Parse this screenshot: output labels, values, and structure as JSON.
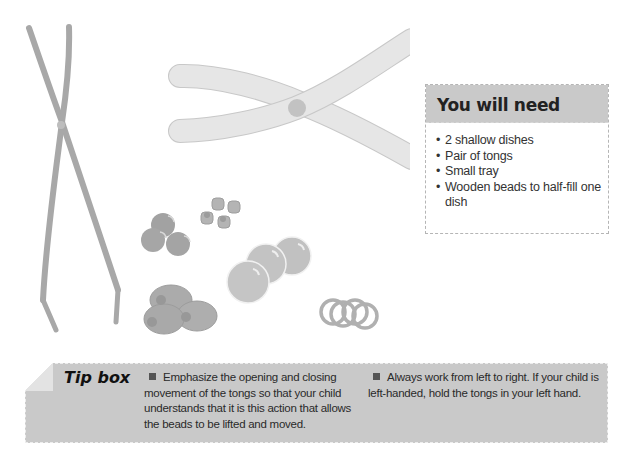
{
  "you_will_need": {
    "title": "You will need",
    "items": [
      "2 shallow dishes",
      "Pair of tongs",
      "Small tray",
      "Wooden beads to half-fill one dish"
    ]
  },
  "tip_box": {
    "label": "Tip box",
    "tips": [
      "Emphasize the opening and closing movement of the tongs so that your child understands that it is this action that allows the beads to be lifted and moved.",
      "Always work from left to right. If your child is left-handed, hold the tongs in your left hand."
    ]
  },
  "illustrations": {
    "items": [
      "tongs-closed-icon",
      "tongs-open-icon",
      "bead-cluster-icon",
      "cylinder-beads-icon",
      "large-beads-icon",
      "oval-beads-icon",
      "ring-beads-icon"
    ]
  },
  "colors": {
    "header_gray": "#c9c9c9",
    "tip_gray": "#c9c9c9",
    "illus_gray": "#a9a9a9",
    "illus_light": "#e6e6e6"
  }
}
